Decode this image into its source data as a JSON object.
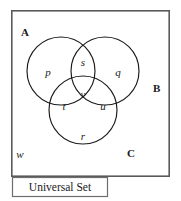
{
  "diagram": {
    "kind": "venn-diagram-three-set",
    "universal_set_label": "Universal Set",
    "sets": [
      {
        "id": "A",
        "label": "A",
        "label_x": 21,
        "label_y": 36
      },
      {
        "id": "B",
        "label": "B",
        "label_x": 157,
        "label_y": 88
      },
      {
        "id": "C",
        "label": "C",
        "label_y": 155,
        "label_x": 131
      }
    ],
    "circles": [
      {
        "id": "circle-a",
        "cx": 61,
        "cy": 71,
        "r": 34
      },
      {
        "id": "circle-b",
        "cx": 105,
        "cy": 71,
        "r": 34
      },
      {
        "id": "circle-c",
        "cx": 83,
        "cy": 110,
        "r": 34
      }
    ],
    "regions": [
      {
        "id": "region-p",
        "label": "p",
        "x": 48,
        "y": 72,
        "meaning": "A only"
      },
      {
        "id": "region-s",
        "label": "s",
        "x": 83,
        "y": 62,
        "meaning": "A and B only"
      },
      {
        "id": "region-q",
        "label": "q",
        "x": 118,
        "y": 72,
        "meaning": "B only"
      },
      {
        "id": "region-v",
        "label": "v",
        "x": 83,
        "y": 94,
        "meaning": "A and B and C"
      },
      {
        "id": "region-t",
        "label": "t",
        "x": 64,
        "y": 106,
        "meaning": "A and C only"
      },
      {
        "id": "region-u",
        "label": "u",
        "x": 102,
        "y": 106,
        "meaning": "B and C only"
      },
      {
        "id": "region-r",
        "label": "r",
        "x": 83,
        "y": 136,
        "meaning": "C only"
      },
      {
        "id": "region-w",
        "label": "w",
        "x": 20,
        "y": 156,
        "meaning": "outside all sets"
      }
    ],
    "frame": {
      "x": 11,
      "y": 10,
      "width": 159,
      "height": 167
    },
    "universal_box": {
      "x": 12,
      "y": 177,
      "width": 96,
      "height": 20
    },
    "colors": {
      "stroke_circle": "#1a1a1a",
      "stroke_frame": "#5a5a5a",
      "stroke_box": "#6d6d6d",
      "text": "#1a1a1a",
      "background": "#ffffff"
    }
  }
}
